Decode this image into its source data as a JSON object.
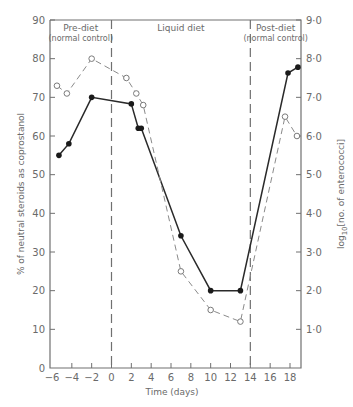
{
  "chart_data": {
    "type": "line",
    "title": "",
    "xlabel": "Time (days)",
    "ylabel": "% of neutral steroids as coprostanol",
    "y2label": "log10[no. of enterococci]",
    "xlim": [
      -6,
      20
    ],
    "ylim": [
      0,
      90
    ],
    "y2lim": [
      0,
      9.0
    ],
    "x_ticks": [
      -6,
      -4,
      -2,
      0,
      2,
      4,
      6,
      8,
      10,
      12,
      14,
      16,
      18
    ],
    "x_tick_labels": [
      "-6",
      "-4",
      "-2",
      "0",
      "2",
      "4",
      "6",
      "8",
      "10",
      "12",
      "14",
      "16",
      "18"
    ],
    "y_ticks": [
      0,
      10,
      20,
      30,
      40,
      50,
      60,
      70,
      80,
      90
    ],
    "y_tick_labels": [
      "0",
      "10",
      "20",
      "30",
      "40",
      "50",
      "60",
      "70",
      "80",
      "90"
    ],
    "y2_ticks": [
      1.0,
      2.0,
      3.0,
      4.0,
      5.0,
      6.0,
      7.0,
      8.0,
      9.0
    ],
    "y2_tick_labels": [
      "1·0",
      "2·0",
      "3·0",
      "4·0",
      "5·0",
      "6·0",
      "7·0",
      "8·0",
      "9·0"
    ],
    "grid": false,
    "legend": null,
    "phase_dividers": [
      0,
      14
    ],
    "phases": [
      {
        "label": "Pre-diet",
        "sublabel": "(normal control)",
        "x_range": [
          -6,
          0
        ]
      },
      {
        "label": "Liquid diet",
        "sublabel": "",
        "x_range": [
          0,
          14
        ]
      },
      {
        "label": "Post-diet",
        "sublabel": "(normal control)",
        "x_range": [
          14,
          20
        ]
      }
    ],
    "series": [
      {
        "name": "% coprostanol",
        "axis": "left",
        "marker": "filled-circle",
        "line": "solid",
        "x": [
          -5.3,
          -4.3,
          -2,
          2,
          2.7,
          3,
          7,
          10,
          13,
          17.8,
          18.8
        ],
        "values": [
          55,
          58,
          70,
          68.3,
          62,
          62,
          34.2,
          20,
          20,
          76.3,
          77.8
        ]
      },
      {
        "name": "log10 enterococci",
        "axis": "right",
        "marker": "open-circle",
        "line": "dashed",
        "x": [
          -5.5,
          -4.5,
          -2,
          1.5,
          2.5,
          3.2,
          7,
          10,
          13,
          17.5,
          18.7
        ],
        "values": [
          7.3,
          7.1,
          8.0,
          7.5,
          7.1,
          6.8,
          2.5,
          1.5,
          1.2,
          6.5,
          6.0
        ]
      }
    ]
  }
}
